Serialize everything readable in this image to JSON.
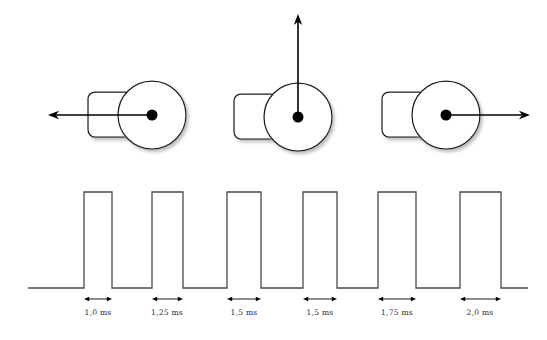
{
  "figure": {
    "background_color": "#ffffff",
    "line_color": "#1a1a1a",
    "waveform_color": "#4a4a4a",
    "hub_color": "#000000",
    "caption": ""
  },
  "servos": [
    {
      "id": "servo-left",
      "label": "servo-left",
      "cx": 152,
      "cy": 115,
      "disc_r": 34,
      "body": {
        "x": 88,
        "y": 92,
        "w": 44,
        "h": 45,
        "r": 7
      },
      "hub_r": 5.5,
      "pointer": {
        "direction": "left",
        "angle_deg": 180,
        "tip_x": 48,
        "tip_y": 115
      }
    },
    {
      "id": "servo-center",
      "label": "servo-center",
      "cx": 298,
      "cy": 117,
      "disc_r": 34,
      "body": {
        "x": 234,
        "y": 94,
        "w": 44,
        "h": 45,
        "r": 7
      },
      "hub_r": 5.5,
      "pointer": {
        "direction": "up",
        "angle_deg": 90,
        "tip_x": 298,
        "tip_y": 14
      }
    },
    {
      "id": "servo-right",
      "label": "servo-right",
      "cx": 446,
      "cy": 115,
      "disc_r": 34,
      "body": {
        "x": 382,
        "y": 92,
        "w": 44,
        "h": 45,
        "r": 7
      },
      "hub_r": 5.5,
      "pointer": {
        "direction": "right",
        "angle_deg": 0,
        "tip_x": 530,
        "tip_y": 115
      }
    }
  ],
  "chart_data": {
    "type": "line",
    "xlabel": "",
    "ylabel": "",
    "grid": false,
    "legend": "none",
    "baseline_y": 288,
    "high_y": 192,
    "x_start": 28,
    "x_end": 528,
    "signal_levels": {
      "low": 0,
      "high": 1
    },
    "pulses": [
      {
        "index": 1,
        "label": "1,0 ms",
        "width_ms": 1.0,
        "rise_x": 84,
        "fall_x": 112,
        "label_x": 98,
        "arrow_y": 299,
        "label_y": 315
      },
      {
        "index": 2,
        "label": "1,25 ms",
        "width_ms": 1.25,
        "rise_x": 152,
        "fall_x": 183,
        "label_x": 167,
        "arrow_y": 299,
        "label_y": 315
      },
      {
        "index": 3,
        "label": "1,5 ms",
        "width_ms": 1.5,
        "rise_x": 227,
        "fall_x": 261,
        "label_x": 244,
        "arrow_y": 299,
        "label_y": 315
      },
      {
        "index": 4,
        "label": "1,5 ms",
        "width_ms": 1.5,
        "rise_x": 303,
        "fall_x": 337,
        "label_x": 320,
        "arrow_y": 299,
        "label_y": 315
      },
      {
        "index": 5,
        "label": "1,75 ms",
        "width_ms": 1.75,
        "rise_x": 378,
        "fall_x": 416,
        "label_x": 397,
        "arrow_y": 299,
        "label_y": 315
      },
      {
        "index": 6,
        "label": "2,0 ms",
        "width_ms": 2.0,
        "rise_x": 460,
        "fall_x": 501,
        "label_x": 480,
        "arrow_y": 299,
        "label_y": 315
      }
    ],
    "x_tick_labels": [
      "1,0 ms",
      "1,25 ms",
      "1,5 ms",
      "1,5 ms",
      "1,75 ms",
      "2,0 ms"
    ],
    "values": [
      1.0,
      1.25,
      1.5,
      1.5,
      1.75,
      2.0
    ],
    "units": "ms"
  }
}
